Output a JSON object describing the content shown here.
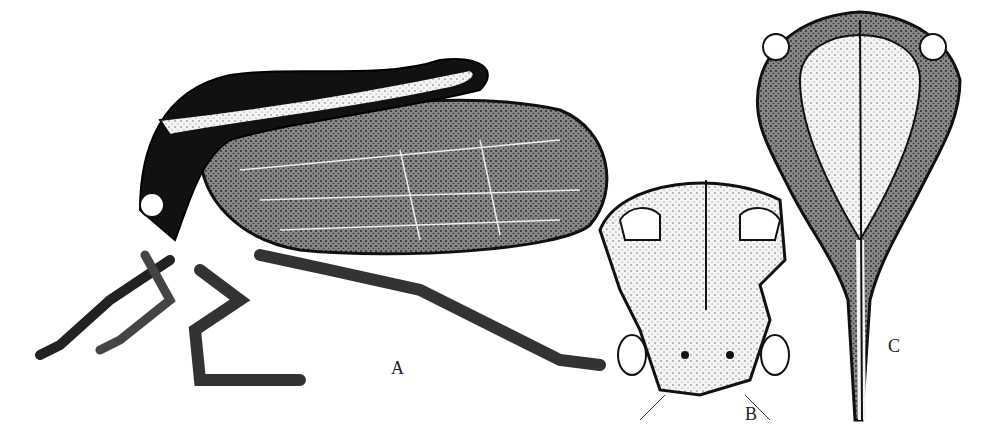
{
  "figure": {
    "panels": [
      {
        "id": "A",
        "label": "A",
        "description": "lateral view of treehopper (whole insect)"
      },
      {
        "id": "B",
        "label": "B",
        "description": "frontal view of head and pronotum"
      },
      {
        "id": "C",
        "label": "C",
        "description": "dorsal view of pronotum"
      }
    ],
    "colors": {
      "ink": "#111111",
      "paper": "#ffffff",
      "stipple": "#cfcfcf"
    }
  }
}
